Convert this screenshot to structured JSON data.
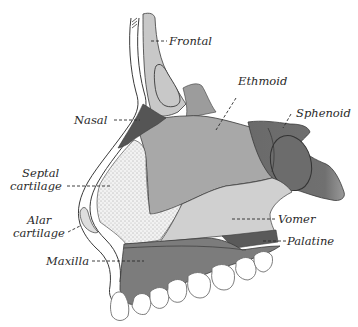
{
  "figure": {
    "colors": {
      "background": "#ffffff",
      "outline": "#3a3a3a",
      "frontal": "#c8c8c8",
      "ethmoid": "#a9a9a9",
      "ethmoid_upper": "#9a9a9a",
      "sphenoid": "#6e6e6e",
      "nasal": "#5a5a5a",
      "vomer": "#cfcfcf",
      "palatine": "#5c5c5c",
      "maxilla": "#7d7d7d",
      "septal_cartilage": "#eeeeee",
      "teeth": "#ffffff"
    }
  },
  "labels": {
    "frontal": "Frontal",
    "ethmoid": "Ethmoid",
    "sphenoid": "Sphenoid",
    "nasal": "Nasal",
    "septal_cartilage_line1": "Septal",
    "septal_cartilage_line2": "cartilage",
    "alar_cartilage_line1": "Alar",
    "alar_cartilage_line2": "cartilage",
    "vomer": "Vomer",
    "palatine": "Palatine",
    "maxilla": "Maxilla"
  }
}
